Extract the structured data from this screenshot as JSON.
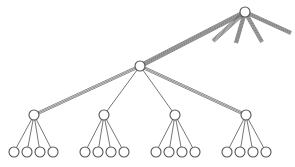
{
  "figure": {
    "background_color": "#ffffff",
    "width": 295,
    "height": 167
  },
  "style": {
    "node_fill": "#ffffff",
    "node_stroke": "#555555",
    "node_stroke_width": 1.1,
    "node_radius": 5,
    "edge_color": "#777777",
    "thin_edge_width": 1.0,
    "bundle_strand_color": "#6b6b6b",
    "bundle_strand_width": 0.8
  },
  "chart_data": {
    "type": "diagram",
    "levels": 3,
    "nodes": [
      {
        "id": "root",
        "label": "",
        "level": 0,
        "x": 245,
        "y": 12
      },
      {
        "id": "mid",
        "label": "",
        "level": 1,
        "x": 140,
        "y": 66
      },
      {
        "id": "g1",
        "label": "",
        "level": 2,
        "x": 34,
        "y": 115
      },
      {
        "id": "g2",
        "label": "",
        "level": 2,
        "x": 104,
        "y": 115
      },
      {
        "id": "g3",
        "label": "",
        "level": 2,
        "x": 175,
        "y": 115
      },
      {
        "id": "g4",
        "label": "",
        "level": 2,
        "x": 246,
        "y": 115
      },
      {
        "id": "l1a",
        "label": "",
        "level": 3,
        "x": 14,
        "y": 152
      },
      {
        "id": "l1b",
        "label": "",
        "level": 3,
        "x": 27,
        "y": 152
      },
      {
        "id": "l1c",
        "label": "",
        "level": 3,
        "x": 40,
        "y": 152
      },
      {
        "id": "l1d",
        "label": "",
        "level": 3,
        "x": 53,
        "y": 152
      },
      {
        "id": "l2a",
        "label": "",
        "level": 3,
        "x": 85,
        "y": 152
      },
      {
        "id": "l2b",
        "label": "",
        "level": 3,
        "x": 98,
        "y": 152
      },
      {
        "id": "l2c",
        "label": "",
        "level": 3,
        "x": 111,
        "y": 152
      },
      {
        "id": "l2d",
        "label": "",
        "level": 3,
        "x": 124,
        "y": 152
      },
      {
        "id": "l3a",
        "label": "",
        "level": 3,
        "x": 156,
        "y": 152
      },
      {
        "id": "l3b",
        "label": "",
        "level": 3,
        "x": 169,
        "y": 152
      },
      {
        "id": "l3c",
        "label": "",
        "level": 3,
        "x": 182,
        "y": 152
      },
      {
        "id": "l3d",
        "label": "",
        "level": 3,
        "x": 195,
        "y": 152
      },
      {
        "id": "l4a",
        "label": "",
        "level": 3,
        "x": 227,
        "y": 152
      },
      {
        "id": "l4b",
        "label": "",
        "level": 3,
        "x": 240,
        "y": 152
      },
      {
        "id": "l4c",
        "label": "",
        "level": 3,
        "x": 253,
        "y": 152
      },
      {
        "id": "l4d",
        "label": "",
        "level": 3,
        "x": 266,
        "y": 152
      }
    ],
    "bundle_edges": [
      {
        "id": "root-mid",
        "from": "root",
        "x1": 245,
        "y1": 12,
        "x2": 140,
        "y2": 66,
        "strands": 6,
        "spread": 4.0
      },
      {
        "id": "root-stub-sw",
        "from": "root",
        "x1": 245,
        "y1": 12,
        "x2": 213,
        "y2": 41,
        "strands": 5,
        "spread": 3.4
      },
      {
        "id": "root-stub-s",
        "from": "root",
        "x1": 245,
        "y1": 12,
        "x2": 236,
        "y2": 43,
        "strands": 5,
        "spread": 3.2
      },
      {
        "id": "root-stub-se",
        "from": "root",
        "x1": 245,
        "y1": 12,
        "x2": 262,
        "y2": 42,
        "strands": 5,
        "spread": 3.2
      },
      {
        "id": "root-stub-e",
        "from": "root",
        "x1": 245,
        "y1": 12,
        "x2": 291,
        "y2": 33,
        "strands": 5,
        "spread": 3.2
      },
      {
        "id": "mid-g1",
        "from": "mid",
        "x1": 140,
        "y1": 66,
        "x2": 34,
        "y2": 115,
        "strands": 3,
        "spread": 2.4
      },
      {
        "id": "mid-g4",
        "from": "mid",
        "x1": 140,
        "y1": 66,
        "x2": 246,
        "y2": 115,
        "strands": 3,
        "spread": 2.4
      }
    ],
    "thin_edges": [
      {
        "from": "mid",
        "to": "g2"
      },
      {
        "from": "mid",
        "to": "g3"
      },
      {
        "from": "g1",
        "to": "l1a"
      },
      {
        "from": "g1",
        "to": "l1b"
      },
      {
        "from": "g1",
        "to": "l1c"
      },
      {
        "from": "g1",
        "to": "l1d"
      },
      {
        "from": "g2",
        "to": "l2a"
      },
      {
        "from": "g2",
        "to": "l2b"
      },
      {
        "from": "g2",
        "to": "l2c"
      },
      {
        "from": "g2",
        "to": "l2d"
      },
      {
        "from": "g3",
        "to": "l3a"
      },
      {
        "from": "g3",
        "to": "l3b"
      },
      {
        "from": "g3",
        "to": "l3c"
      },
      {
        "from": "g3",
        "to": "l3d"
      },
      {
        "from": "g4",
        "to": "l4a"
      },
      {
        "from": "g4",
        "to": "l4b"
      },
      {
        "from": "g4",
        "to": "l4c"
      },
      {
        "from": "g4",
        "to": "l4d"
      }
    ]
  }
}
